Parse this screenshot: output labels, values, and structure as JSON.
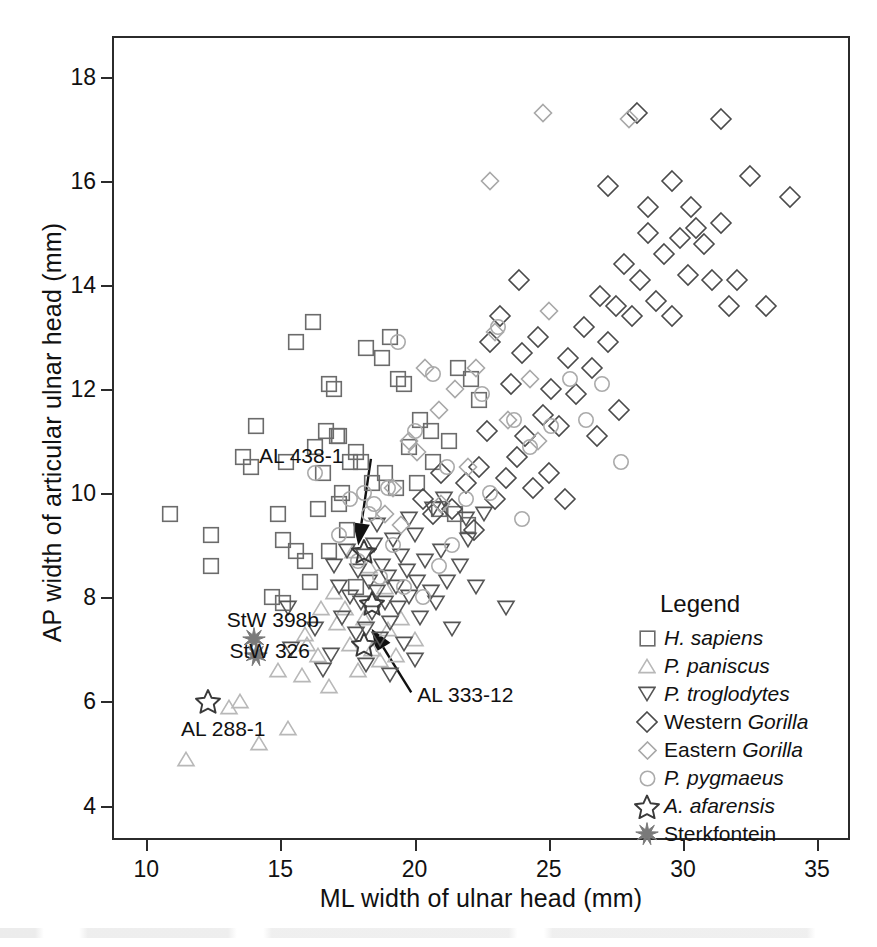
{
  "chart_data": {
    "type": "scatter",
    "title": "",
    "xlabel": "ML width of ulnar head (mm)",
    "ylabel": "AP width of articular ulnar head (mm)",
    "xlim": [
      8.8,
      36.3
    ],
    "ylim": [
      3.3,
      18.75
    ],
    "xticks": [
      10,
      15,
      20,
      25,
      30,
      35
    ],
    "yticks": [
      4,
      6,
      8,
      10,
      12,
      14,
      16,
      18
    ],
    "grid": false,
    "legend_position": "inside-lower-right",
    "legend_title": "Legend",
    "series": [
      {
        "name": "H. sapiens",
        "marker": "square",
        "color": "#6b6b6b",
        "points": [
          [
            10.9,
            9.6
          ],
          [
            12.4,
            9.2
          ],
          [
            12.4,
            8.6
          ],
          [
            13.6,
            10.7
          ],
          [
            13.9,
            10.5
          ],
          [
            14.1,
            11.3
          ],
          [
            14.9,
            9.6
          ],
          [
            15.2,
            10.6
          ],
          [
            15.1,
            9.1
          ],
          [
            15.6,
            12.9
          ],
          [
            16.2,
            13.3
          ],
          [
            16.3,
            10.9
          ],
          [
            16.6,
            10.4
          ],
          [
            16.8,
            12.1
          ],
          [
            17.0,
            12.0
          ],
          [
            16.7,
            11.2
          ],
          [
            17.1,
            11.1
          ],
          [
            17.2,
            11.1
          ],
          [
            15.6,
            8.9
          ],
          [
            15.9,
            8.7
          ],
          [
            16.4,
            9.7
          ],
          [
            17.2,
            9.8
          ],
          [
            17.6,
            10.6
          ],
          [
            17.8,
            10.8
          ],
          [
            16.8,
            8.9
          ],
          [
            17.3,
            10.0
          ],
          [
            17.5,
            9.3
          ],
          [
            18.0,
            10.6
          ],
          [
            18.2,
            12.8
          ],
          [
            18.8,
            12.6
          ],
          [
            19.1,
            13.0
          ],
          [
            19.4,
            12.2
          ],
          [
            19.6,
            12.1
          ],
          [
            18.4,
            10.2
          ],
          [
            18.9,
            10.4
          ],
          [
            19.3,
            10.1
          ],
          [
            19.8,
            10.9
          ],
          [
            20.2,
            11.4
          ],
          [
            20.6,
            11.2
          ],
          [
            20.1,
            10.2
          ],
          [
            20.7,
            10.6
          ],
          [
            21.3,
            11.0
          ],
          [
            21.6,
            12.4
          ],
          [
            22.1,
            12.2
          ],
          [
            22.4,
            11.8
          ],
          [
            20.9,
            9.7
          ],
          [
            21.5,
            9.6
          ],
          [
            22.0,
            9.4
          ],
          [
            15.1,
            7.9
          ],
          [
            16.1,
            8.3
          ],
          [
            14.7,
            8.0
          ],
          [
            17.8,
            8.2
          ]
        ]
      },
      {
        "name": "P. paniscus",
        "marker": "triangle-up",
        "color": "#b8b8b8",
        "points": [
          [
            11.5,
            4.9
          ],
          [
            13.1,
            5.9
          ],
          [
            13.5,
            6.0
          ],
          [
            14.2,
            5.2
          ],
          [
            14.9,
            6.6
          ],
          [
            15.3,
            5.5
          ],
          [
            15.8,
            6.5
          ],
          [
            16.0,
            7.1
          ],
          [
            16.4,
            6.9
          ],
          [
            16.8,
            6.3
          ],
          [
            17.1,
            7.5
          ],
          [
            17.4,
            7.8
          ],
          [
            17.6,
            7.1
          ],
          [
            17.9,
            6.6
          ],
          [
            18.1,
            7.6
          ],
          [
            18.4,
            7.0
          ],
          [
            18.7,
            6.8
          ],
          [
            19.0,
            7.4
          ],
          [
            19.3,
            6.9
          ],
          [
            16.5,
            7.8
          ],
          [
            17.0,
            8.1
          ],
          [
            18.9,
            8.2
          ],
          [
            19.5,
            7.6
          ],
          [
            20.0,
            7.2
          ],
          [
            15.9,
            7.3
          ],
          [
            18.3,
            8.6
          ],
          [
            17.7,
            8.9
          ]
        ]
      },
      {
        "name": "P. troglodytes",
        "marker": "triangle-down",
        "color": "#555555",
        "points": [
          [
            15.3,
            7.8
          ],
          [
            15.4,
            7.0
          ],
          [
            16.3,
            7.4
          ],
          [
            16.6,
            6.6
          ],
          [
            17.0,
            8.6
          ],
          [
            17.2,
            8.2
          ],
          [
            17.3,
            7.6
          ],
          [
            17.5,
            8.9
          ],
          [
            17.6,
            8.0
          ],
          [
            17.8,
            7.3
          ],
          [
            17.9,
            8.5
          ],
          [
            18.0,
            7.9
          ],
          [
            18.1,
            8.8
          ],
          [
            18.2,
            7.4
          ],
          [
            18.3,
            8.3
          ],
          [
            18.4,
            7.7
          ],
          [
            18.5,
            9.0
          ],
          [
            18.6,
            8.1
          ],
          [
            18.7,
            7.2
          ],
          [
            18.8,
            8.6
          ],
          [
            18.9,
            7.9
          ],
          [
            19.0,
            8.4
          ],
          [
            19.1,
            7.5
          ],
          [
            19.2,
            9.1
          ],
          [
            19.3,
            8.2
          ],
          [
            19.4,
            7.8
          ],
          [
            19.5,
            8.8
          ],
          [
            19.6,
            7.1
          ],
          [
            19.7,
            8.5
          ],
          [
            19.8,
            8.0
          ],
          [
            20.0,
            9.2
          ],
          [
            20.1,
            8.3
          ],
          [
            20.2,
            7.6
          ],
          [
            20.4,
            8.7
          ],
          [
            20.6,
            8.1
          ],
          [
            20.8,
            7.9
          ],
          [
            21.0,
            8.9
          ],
          [
            21.2,
            8.3
          ],
          [
            21.4,
            7.4
          ],
          [
            21.7,
            8.6
          ],
          [
            22.0,
            9.1
          ],
          [
            22.3,
            8.2
          ],
          [
            23.4,
            7.8
          ],
          [
            16.9,
            6.9
          ],
          [
            18.2,
            6.7
          ],
          [
            19.1,
            6.5
          ],
          [
            20.0,
            6.8
          ],
          [
            20.7,
            9.7
          ],
          [
            21.1,
            9.9
          ],
          [
            19.8,
            9.5
          ],
          [
            18.6,
            9.4
          ],
          [
            21.9,
            9.5
          ],
          [
            22.6,
            9.6
          ]
        ]
      },
      {
        "name": "Western Gorilla",
        "marker": "diamond-large",
        "color": "#4a4a4a",
        "points": [
          [
            23.0,
            9.9
          ],
          [
            23.4,
            10.3
          ],
          [
            23.8,
            10.7
          ],
          [
            24.1,
            11.1
          ],
          [
            24.4,
            10.1
          ],
          [
            24.8,
            11.5
          ],
          [
            25.1,
            12.0
          ],
          [
            25.4,
            11.3
          ],
          [
            25.7,
            12.6
          ],
          [
            26.0,
            11.9
          ],
          [
            26.3,
            13.2
          ],
          [
            26.6,
            12.4
          ],
          [
            26.9,
            13.8
          ],
          [
            27.2,
            12.9
          ],
          [
            27.5,
            13.6
          ],
          [
            27.8,
            14.4
          ],
          [
            28.1,
            13.4
          ],
          [
            28.4,
            14.1
          ],
          [
            28.7,
            15.0
          ],
          [
            29.0,
            13.7
          ],
          [
            29.3,
            14.6
          ],
          [
            29.6,
            13.4
          ],
          [
            29.9,
            14.9
          ],
          [
            30.2,
            14.2
          ],
          [
            30.5,
            15.1
          ],
          [
            30.8,
            14.8
          ],
          [
            31.1,
            14.1
          ],
          [
            31.4,
            15.2
          ],
          [
            31.7,
            13.6
          ],
          [
            32.0,
            14.1
          ],
          [
            32.5,
            16.1
          ],
          [
            33.1,
            13.6
          ],
          [
            34.0,
            15.7
          ],
          [
            28.3,
            17.3
          ],
          [
            31.4,
            17.2
          ],
          [
            27.2,
            15.9
          ],
          [
            28.7,
            15.5
          ],
          [
            29.6,
            16.0
          ],
          [
            30.3,
            15.5
          ],
          [
            23.6,
            12.1
          ],
          [
            24.0,
            12.7
          ],
          [
            22.7,
            11.2
          ],
          [
            22.4,
            10.5
          ],
          [
            25.0,
            10.4
          ],
          [
            25.6,
            9.9
          ],
          [
            26.8,
            11.1
          ],
          [
            27.6,
            11.6
          ],
          [
            24.6,
            13.0
          ],
          [
            21.4,
            9.7
          ],
          [
            21.9,
            10.2
          ],
          [
            22.2,
            9.3
          ],
          [
            20.7,
            9.6
          ],
          [
            20.3,
            9.9
          ],
          [
            21.0,
            10.4
          ],
          [
            23.2,
            13.4
          ],
          [
            23.9,
            14.1
          ],
          [
            22.8,
            12.9
          ]
        ]
      },
      {
        "name": "Eastern Gorilla",
        "marker": "diamond-small",
        "color": "#a8a8a8",
        "points": [
          [
            24.8,
            17.3
          ],
          [
            28.0,
            17.2
          ],
          [
            22.8,
            16.0
          ],
          [
            20.4,
            12.4
          ],
          [
            20.9,
            11.6
          ],
          [
            19.8,
            11.0
          ],
          [
            19.2,
            10.1
          ],
          [
            21.5,
            12.0
          ],
          [
            22.3,
            12.4
          ],
          [
            23.0,
            13.1
          ],
          [
            21.0,
            9.8
          ],
          [
            22.0,
            10.5
          ],
          [
            19.5,
            9.4
          ],
          [
            23.5,
            11.4
          ],
          [
            24.3,
            12.2
          ],
          [
            25.0,
            13.5
          ],
          [
            18.9,
            9.6
          ],
          [
            20.1,
            10.8
          ],
          [
            24.6,
            11.0
          ]
        ]
      },
      {
        "name": "P. pygmaeus",
        "marker": "circle",
        "color": "#aaaaaa",
        "points": [
          [
            16.3,
            10.4
          ],
          [
            17.6,
            9.9
          ],
          [
            18.1,
            10.0
          ],
          [
            18.5,
            9.8
          ],
          [
            19.0,
            10.1
          ],
          [
            18.3,
            9.6
          ],
          [
            19.4,
            12.9
          ],
          [
            20.0,
            11.2
          ],
          [
            20.7,
            12.3
          ],
          [
            21.2,
            10.5
          ],
          [
            21.9,
            9.9
          ],
          [
            22.5,
            11.9
          ],
          [
            23.1,
            13.2
          ],
          [
            23.7,
            11.4
          ],
          [
            24.3,
            10.9
          ],
          [
            25.1,
            11.3
          ],
          [
            25.8,
            12.2
          ],
          [
            26.4,
            11.4
          ],
          [
            27.0,
            12.1
          ],
          [
            27.7,
            10.6
          ],
          [
            17.9,
            8.7
          ],
          [
            18.7,
            8.4
          ],
          [
            19.6,
            8.2
          ],
          [
            20.3,
            8.0
          ],
          [
            19.2,
            9.0
          ],
          [
            21.4,
            9.0
          ],
          [
            22.8,
            10.0
          ],
          [
            24.0,
            9.5
          ],
          [
            20.9,
            8.6
          ],
          [
            17.2,
            9.2
          ]
        ]
      },
      {
        "name": "A. afarensis",
        "marker": "star",
        "color": "#3a3a3a",
        "points": [
          [
            12.3,
            6.0
          ],
          [
            18.1,
            8.9
          ],
          [
            18.4,
            7.9
          ],
          [
            18.1,
            7.1
          ]
        ]
      },
      {
        "name": "Sterkfontein",
        "marker": "starburst",
        "color": "#7a7a7a",
        "points": [
          [
            14.0,
            7.2
          ],
          [
            14.1,
            6.9
          ]
        ]
      }
    ],
    "annotations": [
      {
        "label": "AL 438-1",
        "label_x": 14.2,
        "label_y": 10.7,
        "point_x": 17.9,
        "point_y": 9.0
      },
      {
        "label": "AL 333-12",
        "label_x": 20.1,
        "label_y": 6.1,
        "point_x": 18.4,
        "point_y": 7.4
      },
      {
        "label": "StW 398b",
        "label_x": 13.0,
        "label_y": 7.55,
        "point_x": null,
        "point_y": null
      },
      {
        "label": "StW 326",
        "label_x": 13.1,
        "label_y": 6.95,
        "point_x": null,
        "point_y": null
      },
      {
        "label": "AL 288-1",
        "label_x": 11.3,
        "label_y": 5.45,
        "point_x": null,
        "point_y": null
      }
    ]
  },
  "legend": {
    "title": "Legend",
    "items": [
      {
        "label_plain": "",
        "label_italic": "H. sapiens",
        "label_tail": "",
        "marker": "square"
      },
      {
        "label_plain": "",
        "label_italic": "P. paniscus",
        "label_tail": "",
        "marker": "triangle-up"
      },
      {
        "label_plain": "",
        "label_italic": "P. troglodytes",
        "label_tail": "",
        "marker": "triangle-down"
      },
      {
        "label_plain": "Western ",
        "label_italic": "Gorilla",
        "label_tail": "",
        "marker": "diamond-large"
      },
      {
        "label_plain": "Eastern ",
        "label_italic": "Gorilla",
        "label_tail": "",
        "marker": "diamond-small"
      },
      {
        "label_plain": "",
        "label_italic": "P. pygmaeus",
        "label_tail": "",
        "marker": "circle"
      },
      {
        "label_plain": "",
        "label_italic": "A. afarensis",
        "label_tail": "",
        "marker": "star"
      },
      {
        "label_plain": "Sterkfontein",
        "label_italic": "",
        "label_tail": "",
        "marker": "starburst"
      }
    ]
  },
  "colors": {
    "axis": "#2b2b2b",
    "text": "#111111",
    "h_sapiens": "#6b6b6b",
    "p_paniscus": "#b8b8b8",
    "p_troglodytes": "#555555",
    "western_gorilla": "#4a4a4a",
    "eastern_gorilla": "#a8a8a8",
    "p_pygmaeus": "#aaaaaa",
    "a_afarensis": "#3a3a3a",
    "sterkfontein": "#7a7a7a"
  }
}
